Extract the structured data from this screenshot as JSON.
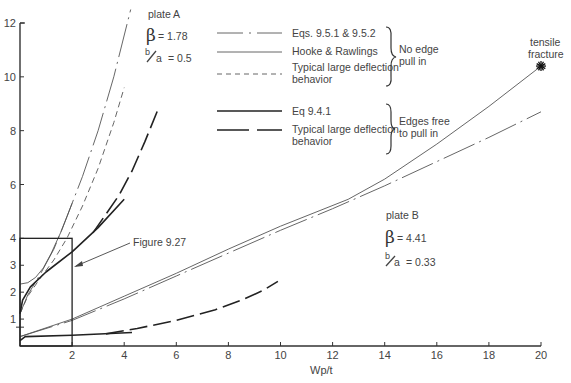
{
  "chart_data": {
    "type": "line",
    "title": "",
    "xlabel": "Wp/t",
    "ylabel": "",
    "xlim": [
      0,
      20
    ],
    "ylim": [
      0,
      12
    ],
    "grid": false,
    "x_ticks": [
      2,
      4,
      6,
      8,
      10,
      12,
      14,
      16,
      18,
      20
    ],
    "y_ticks": [
      1,
      2,
      3,
      4,
      6,
      8,
      10,
      12
    ],
    "y_minor_ticks": [
      0.7
    ],
    "legend": {
      "placement": "top-center",
      "entries": [
        {
          "label": "Eqs. 9.5.1 & 9.5.2",
          "style": "dash-dot-thin"
        },
        {
          "label": "Hooke & Rawlings",
          "style": "solid-thin"
        },
        {
          "label": "Typical large deflection behavior",
          "style": "dashed-thin"
        },
        {
          "label": "Eq  9.4.1",
          "style": "solid-thick"
        },
        {
          "label": "Typical large deflection behavior",
          "style": "long-dash-thick"
        }
      ],
      "groups": [
        {
          "label": "No edge pull in",
          "entries": [
            0,
            1,
            2
          ]
        },
        {
          "label": "Edges free to pull in",
          "entries": [
            3,
            4
          ]
        }
      ]
    },
    "series": [
      {
        "name": "Plate A – Eqs. 9.5.1 & 9.5.2",
        "style": "dash-dot-thin",
        "x": [
          0,
          0.3,
          0.8,
          1.3,
          1.8,
          2.4,
          3.0,
          3.6,
          4.25
        ],
        "y": [
          1.2,
          1.9,
          2.7,
          3.6,
          4.8,
          6.3,
          8.0,
          10.0,
          12.5
        ]
      },
      {
        "name": "Plate A – Hooke & Rawlings",
        "style": "solid-thin",
        "x": [
          0,
          0.3,
          0.6,
          0.9,
          1.2,
          1.6,
          2.0
        ],
        "y": [
          2.3,
          2.35,
          2.55,
          2.9,
          3.45,
          4.3,
          5.3
        ]
      },
      {
        "name": "Plate A – Typical large deflection (no pull in)",
        "style": "dashed-thin",
        "x": [
          0,
          0.3,
          0.8,
          1.3,
          1.8,
          2.4,
          3.0,
          3.6,
          4.0
        ],
        "y": [
          1.2,
          1.85,
          2.55,
          3.2,
          4.0,
          5.2,
          6.6,
          8.3,
          9.6
        ]
      },
      {
        "name": "Plate A – Eq 9.4.1",
        "style": "solid-thick",
        "x": [
          0,
          0.1,
          0.4,
          1.0,
          2.0,
          3.0,
          4.0
        ],
        "y": [
          1.2,
          1.7,
          2.2,
          2.75,
          3.5,
          4.4,
          5.45
        ]
      },
      {
        "name": "Plate A – Typical large deflection (free pull in)",
        "style": "long-dash-thick",
        "x": [
          2.8,
          3.3,
          3.8,
          4.3,
          4.8,
          5.3
        ],
        "y": [
          4.2,
          4.9,
          5.6,
          6.5,
          7.6,
          8.8
        ]
      },
      {
        "name": "Plate B – Hooke & Rawlings",
        "style": "solid-thin",
        "x": [
          0,
          2,
          4,
          6,
          8,
          10,
          12.6,
          14,
          16,
          18,
          20
        ],
        "y": [
          0.35,
          1.0,
          1.85,
          2.7,
          3.6,
          4.45,
          5.45,
          6.2,
          7.5,
          8.9,
          10.4
        ]
      },
      {
        "name": "Plate B – Eqs. 9.5.1 & 9.5.2",
        "style": "dash-dot-thin",
        "x": [
          0,
          2,
          4,
          6,
          8,
          10,
          12,
          14,
          16,
          18,
          20
        ],
        "y": [
          0.35,
          0.95,
          1.75,
          2.6,
          3.45,
          4.3,
          5.1,
          5.95,
          6.85,
          7.75,
          8.7
        ]
      },
      {
        "name": "Plate B – Eq 9.4.1",
        "style": "solid-thick",
        "x": [
          0,
          0.2,
          2,
          4.3
        ],
        "y": [
          0.2,
          0.35,
          0.4,
          0.5
        ]
      },
      {
        "name": "Plate B – Typical large deflection (free pull in)",
        "style": "long-dash-thick",
        "x": [
          3.3,
          4.5,
          6,
          7.5,
          8.5,
          9.3,
          9.9
        ],
        "y": [
          0.45,
          0.65,
          0.95,
          1.35,
          1.7,
          2.05,
          2.4
        ]
      }
    ],
    "annotations": [
      {
        "text": "plate   A"
      },
      {
        "text": "β = 1.78"
      },
      {
        "text": "b/a  = 0.5"
      },
      {
        "text": "plate   B"
      },
      {
        "text": "β = 4.41"
      },
      {
        "text": "b/a = 0.33"
      },
      {
        "text": "tensile fracture"
      },
      {
        "text": "Figure 9.27",
        "points_to": "inset box 0–2 × 0–4"
      }
    ],
    "inset_box": {
      "x": [
        0,
        2
      ],
      "y": [
        0,
        4
      ]
    },
    "fracture_point": {
      "x": 20,
      "y": 10.4
    }
  },
  "labels": {
    "xlabel": "Wp/t",
    "plateA": {
      "name": "plate   A",
      "beta_symbol": "β",
      "beta_value": "= 1.78",
      "ratio_num": "b",
      "ratio_den": "a",
      "ratio_value": "= 0.5"
    },
    "plateB": {
      "name": "plate   B",
      "beta_symbol": "β",
      "beta_value": "= 4.41",
      "ratio_num": "b",
      "ratio_den": "a",
      "ratio_value": "= 0.33"
    },
    "legend": [
      "Eqs. 9.5.1 & 9.5.2",
      "Hooke & Rawlings",
      "Typical large deflection",
      "behavior",
      "Eq  9.4.1",
      "Typical large deflection",
      "behavior"
    ],
    "group_no_pull": [
      "No edge",
      "pull in"
    ],
    "group_free": [
      "Edges free",
      "to pull in"
    ],
    "fracture": [
      "tensile",
      "fracture"
    ],
    "figure_ref": "Figure 9.27",
    "x_tick_labels": [
      "2",
      "4",
      "6",
      "8",
      "10",
      "12",
      "14",
      "16",
      "18",
      "20"
    ],
    "y_tick_labels": [
      "1",
      "2",
      "3",
      "4",
      "6",
      "8",
      "10",
      "12"
    ]
  }
}
